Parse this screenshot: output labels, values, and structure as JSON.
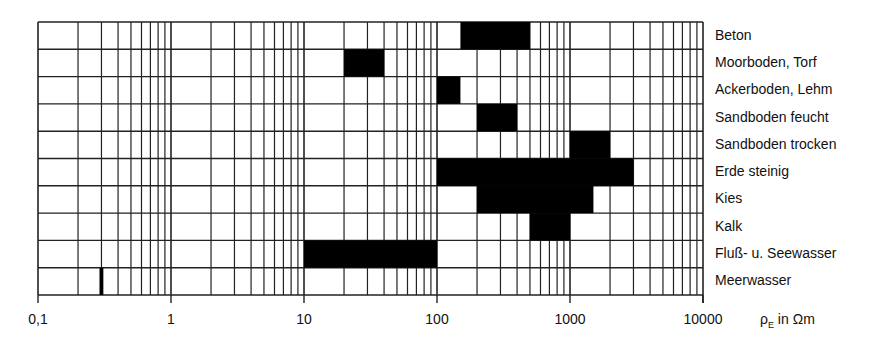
{
  "chart_data": {
    "type": "bar",
    "orientation": "horizontal-range",
    "title": "",
    "xlabel": "ρE in Ωm",
    "xlabel_symbol": "ρ",
    "xlabel_subscript": "E",
    "xlabel_rest": " in Ωm",
    "ylabel": "",
    "xscale": "log",
    "xlim": [
      0.1,
      10000
    ],
    "x_tick_labels": [
      "0,1",
      "1",
      "10",
      "100",
      "1000",
      "10000"
    ],
    "x_tick_values": [
      0.1,
      1,
      10,
      100,
      1000,
      10000
    ],
    "grid": true,
    "legend": null,
    "categories": [
      "Beton",
      "Moorboden, Torf",
      "Ackerboden, Lehm",
      "Sandboden feucht",
      "Sandboden trocken",
      "Erde steinig",
      "Kies",
      "Kalk",
      "Fluß- u. Seewasser",
      "Meerwasser"
    ],
    "ranges": [
      {
        "name": "Beton",
        "min": 150,
        "max": 500
      },
      {
        "name": "Moorboden, Torf",
        "min": 20,
        "max": 40
      },
      {
        "name": "Ackerboden, Lehm",
        "min": 100,
        "max": 150
      },
      {
        "name": "Sandboden feucht",
        "min": 200,
        "max": 400
      },
      {
        "name": "Sandboden trocken",
        "min": 1000,
        "max": 2000
      },
      {
        "name": "Erde steinig",
        "min": 100,
        "max": 3000
      },
      {
        "name": "Kies",
        "min": 200,
        "max": 1500
      },
      {
        "name": "Kalk",
        "min": 500,
        "max": 1000
      },
      {
        "name": "Fluß- u. Seewasser",
        "min": 10,
        "max": 100
      },
      {
        "name": "Meerwasser",
        "min": 0.29,
        "max": 0.31
      }
    ],
    "bar_color": "#000000",
    "grid_color": "#222222"
  }
}
